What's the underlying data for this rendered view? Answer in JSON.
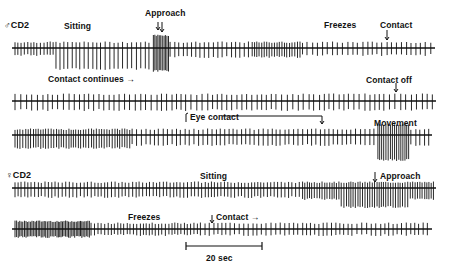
{
  "figure": {
    "traces": [
      {
        "id": "male-cd2-row1",
        "subject_label": "♂CD2",
        "y": 48,
        "annotations": [
          {
            "text": "Sitting",
            "x": 64,
            "y": 21
          },
          {
            "text": "Approach",
            "x": 145,
            "y": 10,
            "arrow_x": 158
          },
          {
            "text": "Freezes",
            "x": 325,
            "y": 21
          },
          {
            "text": "Contact",
            "x": 380,
            "y": 21,
            "arrow_x": 387
          }
        ]
      },
      {
        "id": "male-cd2-row2",
        "y": 101,
        "annotations": [
          {
            "text": "Contact continues →",
            "x": 48,
            "y": 75
          },
          {
            "text": "Contact off",
            "x": 366,
            "y": 75,
            "arrow_x": 396
          }
        ]
      },
      {
        "id": "male-cd2-row3",
        "y": 135,
        "annotations": [
          {
            "text": "Eye contact",
            "x": 188,
            "y": 112,
            "bracket_end_x": 325
          },
          {
            "text": "Movement",
            "x": 374,
            "y": 118
          }
        ]
      },
      {
        "id": "female-cd2-row1",
        "subject_label": "♀CD2",
        "y": 188,
        "annotations": [
          {
            "text": "Sitting",
            "x": 200,
            "y": 171
          },
          {
            "text": "Approach",
            "x": 376,
            "y": 171,
            "arrow_x": 375
          }
        ]
      },
      {
        "id": "female-cd2-row2",
        "y": 229,
        "annotations": [
          {
            "text": "Freezes",
            "x": 128,
            "y": 212
          },
          {
            "text": "Contact →",
            "x": 214,
            "y": 212,
            "arrow_x": 212
          }
        ]
      }
    ],
    "scale_bar": {
      "label": "20 sec",
      "x1": 186,
      "x2": 262,
      "y": 246
    }
  }
}
